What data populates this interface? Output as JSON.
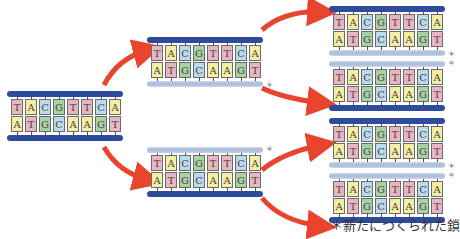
{
  "diagram": {
    "caption": "＊新たにつくられた鎖",
    "new_strand_marker": "＊",
    "sequence_top": [
      "T",
      "A",
      "C",
      "G",
      "T",
      "T",
      "C",
      "A"
    ],
    "sequence_bottom": [
      "A",
      "T",
      "G",
      "C",
      "A",
      "A",
      "G",
      "T"
    ],
    "colors": {
      "T": "#e8b6c2",
      "A": "#f2efa4",
      "C": "#b9dcec",
      "G": "#a8d2a4",
      "old_strand": "#2f4c9c",
      "new_strand": "#b4c4e0",
      "arrow": "#e8442e"
    },
    "generations": [
      {
        "label": "parent",
        "molecules": [
          {
            "id": "m0",
            "top_strand": "old",
            "bottom_strand": "old"
          }
        ]
      },
      {
        "label": "generation-1",
        "molecules": [
          {
            "id": "m1a",
            "top_strand": "old",
            "bottom_strand": "new"
          },
          {
            "id": "m1b",
            "top_strand": "new",
            "bottom_strand": "old"
          }
        ]
      },
      {
        "label": "generation-2",
        "molecules": [
          {
            "id": "m2a",
            "top_strand": "old",
            "bottom_strand": "new"
          },
          {
            "id": "m2b",
            "top_strand": "new",
            "bottom_strand": "old"
          },
          {
            "id": "m2c",
            "top_strand": "old",
            "bottom_strand": "new"
          },
          {
            "id": "m2d",
            "top_strand": "new",
            "bottom_strand": "old"
          }
        ]
      }
    ]
  }
}
